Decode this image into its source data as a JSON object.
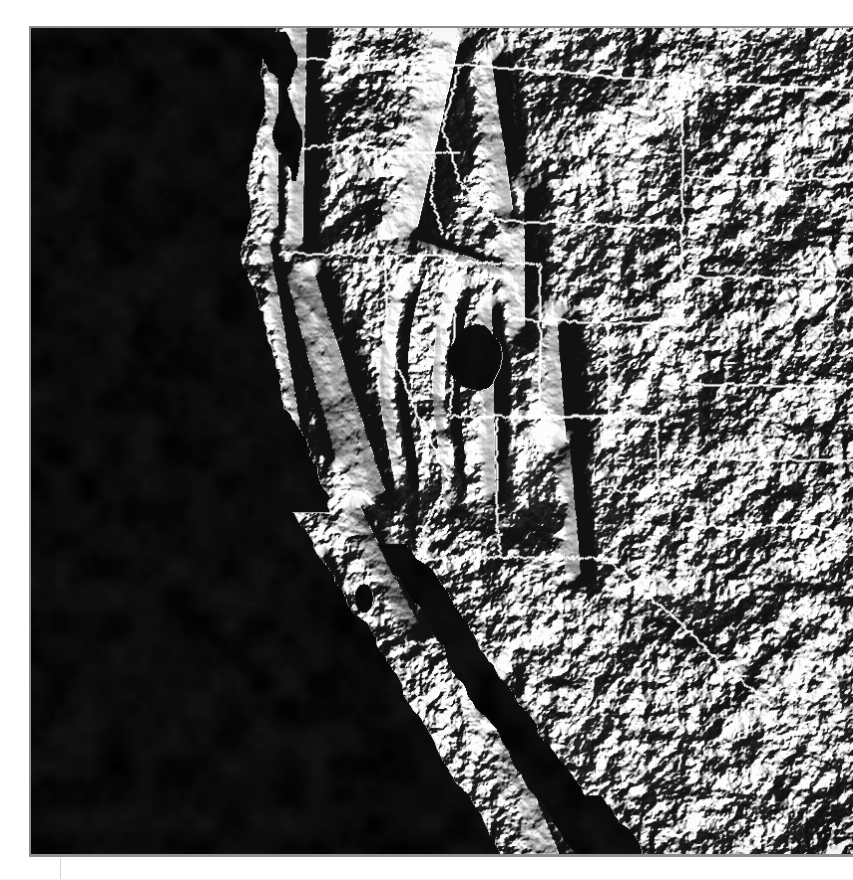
{
  "document": {
    "title": "Shaded Relief Map — Western North America",
    "figure_caption": "",
    "background_color": "#ffffff",
    "frame_color": "#8e8e8e"
  },
  "map": {
    "name": "western-north-america-shaded-relief",
    "type": "shaded-relief-terrain",
    "color_mode": "grayscale",
    "ocean_color": "#0a0a0a",
    "land_base_color": "#e9e9e9",
    "boundary_color": "#ffffff",
    "illumination_azimuth_label": "NW",
    "frame": {
      "x": 29,
      "y": 26,
      "width": 824,
      "height": 831
    },
    "features": {
      "water_bodies": [
        {
          "label": "Pacific Ocean",
          "shade": "#070707"
        },
        {
          "label": "Gulf of California",
          "shade": "#0b0b0b"
        },
        {
          "label": "Puget Sound",
          "shade": "#101010"
        },
        {
          "label": "Great Salt Lake",
          "shade": "#1a1a1a"
        },
        {
          "label": "Salton Sea",
          "shade": "#1c1c1c"
        }
      ],
      "highland_regions": [
        {
          "label": "Cascade Range"
        },
        {
          "label": "Sierra Nevada"
        },
        {
          "label": "Rocky Mountains"
        },
        {
          "label": "Basin and Range"
        },
        {
          "label": "Colorado Plateau"
        },
        {
          "label": "Great Plains"
        },
        {
          "label": "Baja California Peninsula"
        }
      ],
      "boundary_lines": "state and international borders rendered as thin white lines"
    }
  },
  "rules": {
    "column_rule_color": "#d3d3d3",
    "baseline_rule_color": "#f2f2f2"
  }
}
